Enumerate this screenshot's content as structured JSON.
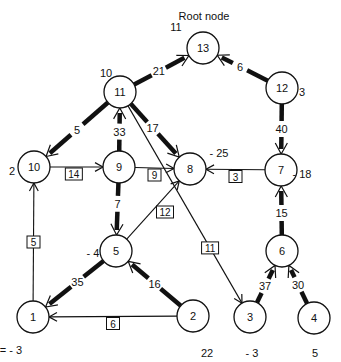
{
  "title": "Root node",
  "nodes": [
    {
      "id": "13",
      "label": "13",
      "potential": "11"
    },
    {
      "id": "12",
      "label": "12",
      "potential": "3"
    },
    {
      "id": "11",
      "label": "11",
      "potential": "10"
    },
    {
      "id": "10",
      "label": "10",
      "potential": "2"
    },
    {
      "id": "9",
      "label": "9",
      "potential": ""
    },
    {
      "id": "8",
      "label": "8",
      "potential": "- 25"
    },
    {
      "id": "7",
      "label": "7",
      "potential": "- 18"
    },
    {
      "id": "5",
      "label": "5",
      "potential": "- 4"
    },
    {
      "id": "6",
      "label": "6",
      "potential": ""
    },
    {
      "id": "1",
      "label": "1",
      "potential": "V1= - 3"
    },
    {
      "id": "2",
      "label": "2",
      "potential": "22"
    },
    {
      "id": "3",
      "label": "3",
      "potential": "- 3"
    },
    {
      "id": "4",
      "label": "4",
      "potential": "5"
    }
  ],
  "tree_edges": [
    {
      "from": "11",
      "to": "13",
      "flow": "21",
      "direction": "to-parent"
    },
    {
      "from": "12",
      "to": "13",
      "flow": "6",
      "direction": "to-parent"
    },
    {
      "from": "11",
      "to": "10",
      "flow": "5",
      "direction": "to-child"
    },
    {
      "from": "9",
      "to": "11",
      "flow": "33",
      "direction": "to-parent"
    },
    {
      "from": "11",
      "to": "8",
      "flow": "17",
      "direction": "to-child"
    },
    {
      "from": "12",
      "to": "7",
      "flow": "40",
      "direction": "to-child"
    },
    {
      "from": "9",
      "to": "5",
      "flow": "7",
      "direction": "to-child"
    },
    {
      "from": "6",
      "to": "7",
      "flow": "15",
      "direction": "to-parent"
    },
    {
      "from": "5",
      "to": "1",
      "flow": "35",
      "direction": "to-child"
    },
    {
      "from": "2",
      "to": "5",
      "flow": "16",
      "direction": "to-parent"
    },
    {
      "from": "3",
      "to": "6",
      "flow": "37",
      "direction": "to-parent"
    },
    {
      "from": "4",
      "to": "6",
      "flow": "30",
      "direction": "to-parent"
    }
  ],
  "nontree_edges": [
    {
      "from": "10",
      "to": "9",
      "cost": "14"
    },
    {
      "from": "9",
      "to": "8",
      "cost": "9"
    },
    {
      "from": "7",
      "to": "8",
      "cost": "3"
    },
    {
      "from": "5",
      "to": "8",
      "cost": "12"
    },
    {
      "from": "11",
      "to": "3",
      "cost": "11"
    },
    {
      "from": "1",
      "to": "10",
      "cost": "5"
    },
    {
      "from": "2",
      "to": "1",
      "cost": "6"
    }
  ]
}
